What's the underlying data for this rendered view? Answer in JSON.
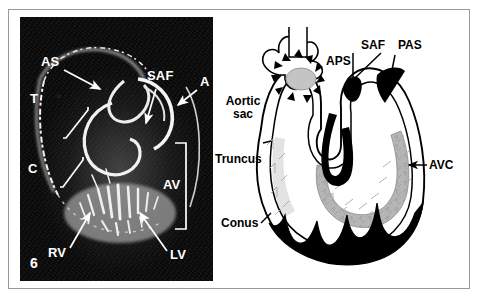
{
  "figure": {
    "number": "6",
    "panels": [
      "micrograph",
      "schematic"
    ],
    "colors": {
      "micrograph_background": "#0a0a0a",
      "label_light": "#ffffff",
      "label_dark": "#000000",
      "schematic_background": "#ffffff",
      "frame_border": "#9a9a9a",
      "cushion_fill": "#b5b5b5",
      "myocardium_fill": "#000000"
    }
  },
  "micrograph": {
    "figure_number": "6",
    "labels": [
      {
        "id": "AS",
        "text": "AS",
        "leader": "arrow"
      },
      {
        "id": "SAF",
        "text": "SAF",
        "leader": "arrow"
      },
      {
        "id": "A",
        "text": "A",
        "leader": "arrow"
      },
      {
        "id": "T",
        "text": "T",
        "leader": "bracket"
      },
      {
        "id": "C",
        "text": "C",
        "leader": "bracket"
      },
      {
        "id": "AV",
        "text": "AV",
        "leader": "bracket"
      },
      {
        "id": "RV",
        "text": "RV",
        "leader": "arrow"
      },
      {
        "id": "LV",
        "text": "LV",
        "leader": "arrow"
      }
    ]
  },
  "schematic": {
    "labels": [
      {
        "id": "APS",
        "text": "APS",
        "leader": "line"
      },
      {
        "id": "SAF",
        "text": "SAF",
        "leader": "line"
      },
      {
        "id": "PAS",
        "text": "PAS",
        "leader": "line"
      },
      {
        "id": "Aortic sac",
        "text": "Aortic",
        "text2": "sac",
        "leader": "none"
      },
      {
        "id": "Truncus",
        "text": "Truncus",
        "leader": "line"
      },
      {
        "id": "Conus",
        "text": "Conus",
        "leader": "line"
      },
      {
        "id": "AVC",
        "text": "AVC",
        "leader": "arrow"
      }
    ]
  }
}
